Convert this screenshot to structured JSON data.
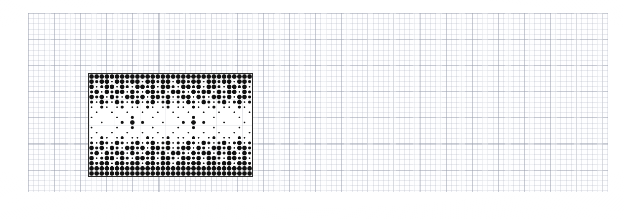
{
  "page": {
    "kind": "scanned-graph-paper",
    "background_color": "#ffffff",
    "width": 624,
    "height": 219
  },
  "grid_paper": {
    "name": "graph-paper-sheet",
    "left": 28,
    "top": 13,
    "width": 580,
    "height": 179,
    "minor_cell_px": 5.22,
    "major_cell_px": 26.1,
    "minor_line_color": "#aaafbe",
    "major_line_color": "#969baa",
    "paper_color": "#fefeff"
  },
  "chart_data": {
    "type": "heatmap",
    "title": "",
    "subtitle": "",
    "xlabel": "",
    "ylabel": "",
    "grid": true,
    "legend": null,
    "block": {
      "name": "dot-matrix-block",
      "left": 88,
      "top": 73,
      "width": 165,
      "height": 104,
      "border_color": "#2b2b2b",
      "border_width": 1.5,
      "fill_color": "#ffffff",
      "dot_color": "#111111",
      "cols": 32,
      "rows": 20,
      "cell_w": 5.16,
      "cell_h": 5.2
    },
    "bands": [
      {
        "name": "top-dense-band",
        "row_start": 0,
        "row_end": 5,
        "density": 0.92
      },
      {
        "name": "upper-mid-band",
        "row_start": 5,
        "row_end": 7,
        "density": 0.45
      },
      {
        "name": "sparse-interior",
        "row_start": 7,
        "row_end": 13,
        "density": 0.1
      },
      {
        "name": "lower-mid-band",
        "row_start": 13,
        "row_end": 15,
        "density": 0.45
      },
      {
        "name": "bottom-dense-band",
        "row_start": 15,
        "row_end": 20,
        "density": 0.92
      }
    ],
    "motifs": [
      {
        "name": "flower-cluster-left",
        "cx": 17.5,
        "cy": 136.0,
        "radius_px": 7
      },
      {
        "name": "flower-cluster-right",
        "cx": 120.5,
        "cy": 136.0,
        "radius_px": 7
      }
    ],
    "dot_radii": {
      "large": 2.3,
      "medium": 1.5,
      "small": 0.85
    },
    "x": [
      0,
      1,
      2,
      3,
      4,
      5,
      6,
      7,
      8,
      9,
      10,
      11,
      12,
      13,
      14,
      15,
      16,
      17,
      18,
      19,
      20,
      21,
      22,
      23,
      24,
      25,
      26,
      27,
      28,
      29,
      30,
      31
    ],
    "categories": [
      "r0",
      "r1",
      "r2",
      "r3",
      "r4",
      "r5",
      "r6",
      "r7",
      "r8",
      "r9",
      "r10",
      "r11",
      "r12",
      "r13",
      "r14",
      "r15",
      "r16",
      "r17",
      "r18",
      "r19"
    ],
    "values": [
      [
        3,
        3,
        3,
        3,
        3,
        3,
        3,
        3,
        3,
        3,
        3,
        3,
        3,
        3,
        3,
        3,
        3,
        3,
        3,
        3,
        3,
        3,
        3,
        3,
        3,
        3,
        3,
        3,
        3,
        3,
        3,
        3
      ],
      [
        3,
        2,
        3,
        3,
        1,
        3,
        3,
        2,
        3,
        3,
        1,
        3,
        3,
        2,
        3,
        3,
        1,
        3,
        3,
        2,
        3,
        3,
        1,
        3,
        3,
        2,
        3,
        3,
        1,
        3,
        3,
        2
      ],
      [
        3,
        1,
        2,
        3,
        3,
        1,
        3,
        2,
        1,
        3,
        3,
        2,
        3,
        1,
        3,
        3,
        2,
        1,
        3,
        3,
        2,
        3,
        1,
        3,
        3,
        2,
        1,
        3,
        3,
        2,
        3,
        1
      ],
      [
        2,
        3,
        1,
        3,
        2,
        3,
        3,
        1,
        3,
        2,
        1,
        3,
        3,
        2,
        3,
        1,
        3,
        3,
        2,
        1,
        3,
        2,
        3,
        3,
        1,
        3,
        2,
        3,
        3,
        1,
        3,
        2
      ],
      [
        3,
        2,
        3,
        1,
        3,
        2,
        1,
        3,
        3,
        2,
        3,
        1,
        3,
        3,
        2,
        3,
        1,
        2,
        3,
        3,
        1,
        3,
        2,
        1,
        3,
        3,
        2,
        3,
        1,
        3,
        3,
        2
      ],
      [
        2,
        1,
        3,
        2,
        1,
        3,
        2,
        1,
        2,
        3,
        1,
        2,
        3,
        1,
        2,
        3,
        1,
        2,
        1,
        3,
        2,
        1,
        3,
        2,
        1,
        2,
        3,
        1,
        2,
        3,
        1,
        2
      ],
      [
        1,
        0,
        2,
        1,
        0,
        1,
        2,
        0,
        1,
        1,
        0,
        2,
        1,
        0,
        1,
        2,
        0,
        1,
        1,
        0,
        2,
        1,
        0,
        1,
        2,
        0,
        1,
        1,
        0,
        2,
        1,
        0
      ],
      [
        0,
        1,
        0,
        0,
        1,
        0,
        0,
        1,
        0,
        0,
        1,
        0,
        0,
        1,
        0,
        0,
        1,
        0,
        0,
        1,
        0,
        0,
        1,
        0,
        0,
        1,
        0,
        0,
        1,
        0,
        0,
        1
      ],
      [
        1,
        0,
        0,
        0,
        0,
        1,
        0,
        0,
        2,
        0,
        0,
        0,
        1,
        0,
        0,
        0,
        0,
        1,
        0,
        0,
        2,
        0,
        0,
        0,
        1,
        0,
        0,
        0,
        0,
        1,
        0,
        0
      ],
      [
        0,
        0,
        1,
        0,
        0,
        0,
        2,
        0,
        3,
        0,
        2,
        0,
        0,
        0,
        1,
        0,
        0,
        0,
        2,
        0,
        3,
        0,
        2,
        0,
        0,
        0,
        1,
        0,
        0,
        0,
        1,
        0
      ],
      [
        1,
        0,
        0,
        0,
        0,
        1,
        0,
        0,
        2,
        0,
        0,
        0,
        1,
        0,
        0,
        0,
        0,
        1,
        0,
        0,
        2,
        0,
        0,
        0,
        1,
        0,
        0,
        0,
        0,
        1,
        0,
        0
      ],
      [
        0,
        1,
        0,
        0,
        1,
        0,
        0,
        1,
        0,
        0,
        1,
        0,
        0,
        1,
        0,
        0,
        1,
        0,
        0,
        1,
        0,
        0,
        1,
        0,
        0,
        1,
        0,
        0,
        1,
        0,
        0,
        1
      ],
      [
        1,
        0,
        2,
        1,
        0,
        1,
        2,
        0,
        1,
        1,
        0,
        2,
        1,
        0,
        1,
        2,
        0,
        1,
        1,
        0,
        2,
        1,
        0,
        1,
        2,
        0,
        1,
        1,
        0,
        2,
        1,
        0
      ],
      [
        2,
        1,
        3,
        2,
        1,
        3,
        2,
        1,
        2,
        3,
        1,
        2,
        3,
        1,
        2,
        3,
        1,
        2,
        1,
        3,
        2,
        1,
        3,
        2,
        1,
        2,
        3,
        1,
        2,
        3,
        1,
        2
      ],
      [
        3,
        2,
        3,
        1,
        3,
        2,
        1,
        3,
        3,
        2,
        3,
        1,
        3,
        3,
        2,
        3,
        1,
        2,
        3,
        3,
        1,
        3,
        2,
        1,
        3,
        3,
        2,
        3,
        1,
        3,
        3,
        2
      ],
      [
        2,
        3,
        1,
        3,
        2,
        3,
        3,
        1,
        3,
        2,
        1,
        3,
        3,
        2,
        3,
        1,
        3,
        3,
        2,
        1,
        3,
        2,
        3,
        3,
        1,
        3,
        2,
        3,
        3,
        1,
        3,
        2
      ],
      [
        3,
        1,
        2,
        3,
        3,
        1,
        3,
        2,
        1,
        3,
        3,
        2,
        3,
        1,
        3,
        3,
        2,
        1,
        3,
        3,
        2,
        3,
        1,
        3,
        3,
        2,
        1,
        3,
        3,
        2,
        3,
        1
      ],
      [
        3,
        2,
        3,
        3,
        1,
        3,
        3,
        2,
        3,
        3,
        1,
        3,
        3,
        2,
        3,
        3,
        1,
        3,
        3,
        2,
        3,
        3,
        1,
        3,
        3,
        2,
        3,
        3,
        1,
        3,
        3,
        2
      ],
      [
        3,
        3,
        3,
        3,
        3,
        3,
        3,
        3,
        3,
        3,
        3,
        3,
        3,
        3,
        3,
        3,
        3,
        3,
        3,
        3,
        3,
        3,
        3,
        3,
        3,
        3,
        3,
        3,
        3,
        3,
        3,
        3
      ],
      [
        3,
        3,
        3,
        3,
        3,
        3,
        3,
        3,
        3,
        3,
        3,
        3,
        3,
        3,
        3,
        3,
        3,
        3,
        3,
        3,
        3,
        3,
        3,
        3,
        3,
        3,
        3,
        3,
        3,
        3,
        3,
        3
      ]
    ],
    "value_legend": {
      "0": "empty",
      "1": "small dot",
      "2": "medium dot",
      "3": "large dot"
    }
  }
}
